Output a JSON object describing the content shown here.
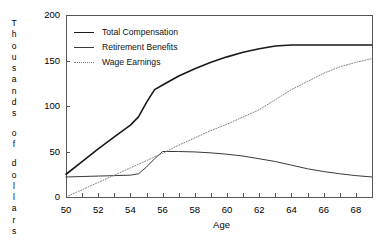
{
  "chart_data": {
    "type": "line",
    "title": "",
    "xlabel": "Age",
    "ylabel": "Thousands of dollars",
    "xlim": [
      50,
      69
    ],
    "ylim": [
      0,
      200
    ],
    "grid": false,
    "legend_position": "upper-left",
    "xticks_major": [
      50,
      52,
      54,
      56,
      58,
      60,
      62,
      64,
      66,
      68
    ],
    "xticks_minor": [
      51,
      53,
      55,
      57,
      59,
      61,
      63,
      65,
      67
    ],
    "yticks": [
      0,
      50,
      100,
      150,
      200
    ],
    "x": [
      50,
      51,
      52,
      53,
      54,
      54.5,
      55,
      55.5,
      56,
      57,
      58,
      59,
      60,
      61,
      62,
      63,
      64,
      65,
      66,
      67,
      68,
      69
    ],
    "series": [
      {
        "name": "Total Compensation",
        "style": "solid",
        "color": "#1a1a1a",
        "width": 1.6,
        "values": [
          25,
          39,
          53,
          66,
          79,
          88,
          104,
          118,
          123,
          133,
          141,
          148,
          154,
          159,
          163,
          166,
          167,
          167,
          167,
          167,
          167,
          167
        ]
      },
      {
        "name": "Retirement Benefits",
        "style": "solid",
        "color": "#3a3a3a",
        "width": 1.0,
        "values": [
          22,
          22.5,
          23,
          23.5,
          24,
          25.5,
          33,
          42,
          50,
          50,
          49.5,
          48.5,
          47,
          45,
          42,
          39,
          35,
          31,
          28,
          25.5,
          23.5,
          22
        ]
      },
      {
        "name": "Wage Earnings",
        "style": "dotted",
        "color": "#808080",
        "width": 1.0,
        "values": [
          0,
          8,
          16,
          24,
          32,
          36,
          40,
          44,
          48,
          57,
          65,
          73,
          80,
          88,
          96,
          107,
          118,
          127,
          136,
          143,
          148,
          152
        ]
      }
    ]
  },
  "axis": {
    "y_title_chars": [
      "T",
      "h",
      "o",
      "u",
      "s",
      "a",
      "n",
      "d",
      "s",
      "",
      "o",
      "f",
      "",
      "d",
      "o",
      "l",
      "l",
      "a",
      "r",
      "s"
    ],
    "y_tick_labels": [
      "200",
      "150",
      "100",
      "50",
      "0"
    ],
    "x_tick_labels": [
      "50",
      "52",
      "54",
      "56",
      "58",
      "60",
      "62",
      "64",
      "66",
      "68"
    ],
    "x_title": "Age"
  },
  "legend": {
    "items": [
      {
        "label": "Total Compensation",
        "swatch": "solid-thick"
      },
      {
        "label": "Retirement Benefits",
        "swatch": "solid-thin"
      },
      {
        "label": "Wage Earnings",
        "swatch": "dotted"
      }
    ]
  },
  "colors": {
    "background": "#ffffff",
    "axis": "#555555",
    "total_compensation": "#1a1a1a",
    "retirement_benefits": "#3a3a3a",
    "wage_earnings": "#808080"
  }
}
